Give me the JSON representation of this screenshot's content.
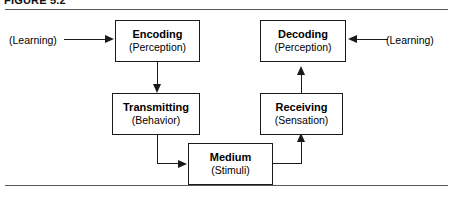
{
  "figure": {
    "label": "FIGURE 5.2",
    "rule_color": "#5a5a5a",
    "line_color": "#1a1a1a",
    "background": "#ffffff"
  },
  "boxes": [
    {
      "id": "encoding",
      "title": "Encoding",
      "subtitle": "(Perception)"
    },
    {
      "id": "decoding",
      "title": "Decoding",
      "subtitle": "(Perception)"
    },
    {
      "id": "transmitting",
      "title": "Transmitting",
      "subtitle": "(Behavior)"
    },
    {
      "id": "receiving",
      "title": "Receiving",
      "subtitle": "(Sensation)"
    },
    {
      "id": "medium",
      "title": "Medium",
      "subtitle": "(Stimuli)"
    }
  ],
  "external_labels": {
    "learning_left": "(Learning)",
    "learning_right": "(Learning)"
  },
  "connectors": [
    {
      "id": "learning-left-to-encoding",
      "from": "(Learning)",
      "to": "Encoding",
      "direction": "right"
    },
    {
      "id": "learning-right-to-decoding",
      "from": "(Learning)",
      "to": "Decoding",
      "direction": "left"
    },
    {
      "id": "encoding-to-transmitting",
      "from": "Encoding",
      "to": "Transmitting",
      "direction": "down"
    },
    {
      "id": "transmitting-to-medium",
      "from": "Transmitting",
      "to": "Medium",
      "direction": "right"
    },
    {
      "id": "medium-to-receiving",
      "from": "Medium",
      "to": "Receiving",
      "direction": "up"
    },
    {
      "id": "receiving-to-decoding",
      "from": "Receiving",
      "to": "Decoding",
      "direction": "up"
    }
  ]
}
